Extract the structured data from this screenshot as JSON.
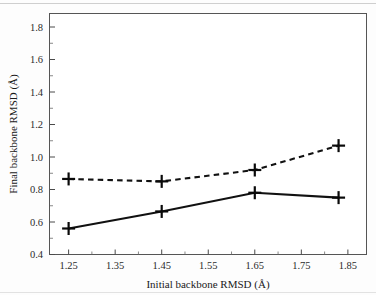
{
  "figure": {
    "background_color": "#fdfdfd",
    "plot_area_color": "#ffffff",
    "frame_color": "#555555",
    "ink_color": "#111111"
  },
  "chart_data": {
    "type": "line",
    "title": "",
    "xlabel": "Initial backbone RMSD (Å)",
    "ylabel": "Final backbone RMSD (Å)",
    "xlim": [
      1.21,
      1.89
    ],
    "ylim": [
      0.4,
      1.88
    ],
    "xticks": [
      1.25,
      1.35,
      1.45,
      1.55,
      1.65,
      1.75,
      1.85
    ],
    "xticklabels": [
      "1.25",
      "1.35",
      "1.45",
      "1.55",
      "1.65",
      "1.75",
      "1.85"
    ],
    "yticks": [
      0.4,
      0.6,
      0.8,
      1.0,
      1.2,
      1.4,
      1.6,
      1.8
    ],
    "yticklabels": [
      "0.4",
      "0.6",
      "0.8",
      "1.0",
      "1.2",
      "1.4",
      "1.6",
      "1.8"
    ],
    "y_minor_ticks": [
      0.5,
      0.7,
      0.9,
      1.1,
      1.3,
      1.5,
      1.7
    ],
    "x_minor_ticks": [
      1.3,
      1.4,
      1.5,
      1.6,
      1.7,
      1.8
    ],
    "grid": false,
    "legend": null,
    "x": [
      1.25,
      1.45,
      1.65,
      1.83
    ],
    "series": [
      {
        "name": "dashed-series",
        "linestyle": "dashed",
        "marker": "plus",
        "color": "#111111",
        "values": [
          0.865,
          0.85,
          0.92,
          1.07
        ]
      },
      {
        "name": "solid-series",
        "linestyle": "solid",
        "marker": "plus",
        "color": "#111111",
        "values": [
          0.56,
          0.665,
          0.78,
          0.75
        ]
      }
    ]
  }
}
